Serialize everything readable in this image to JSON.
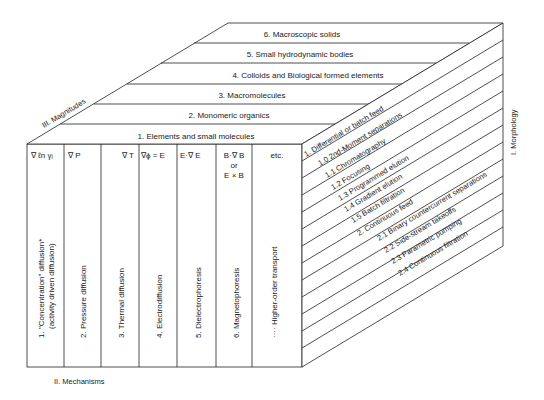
{
  "axes": {
    "magnitudes": "III. Magnitudes",
    "mechanisms": "II. Mechanisms",
    "morphology": "I. Morphology"
  },
  "magnitudes": [
    "1. Elements and small molecules",
    "2. Monomeric organics",
    "3. Macromolecules",
    "4. Colloids and Biological formed elements",
    "5. Small hydrodynamic bodies",
    "6. Macroscopic solids"
  ],
  "mechanisms": [
    {
      "gradient": "∇ ℓn γᵢ",
      "label1": "1.  \"Concentration\" diffusion*",
      "label2": "(activity driven diffusion)"
    },
    {
      "gradient": "∇ P",
      "label1": "2.  Pressure diffusion"
    },
    {
      "gradient": "∇ T",
      "label1": "3.  Thermal diffusion"
    },
    {
      "gradient": "∇ϕ = E",
      "label1": "4.  Electrodiffusion"
    },
    {
      "gradient": "E·∇ E",
      "label1": "5.  Dielectrophoresis"
    },
    {
      "gradient": "B·∇ B",
      "gradient2": "or",
      "gradient3": "E × B",
      "label1": "6.  Magnetophoresis"
    },
    {
      "gradient": "etc.",
      "label1": "····  Higher-order transport"
    }
  ],
  "morphology": [
    "1. Differential or batch feed",
    "1.0 2nd-Moment separations",
    "1.1 Chromatography",
    "1.2 Focusing",
    "1.3 Programmed elution",
    "1.4 Gradient elution",
    "1.5 Batch filtration",
    "2. Continuous feed",
    "2.1 Binary countercurrent separations",
    "2.2 Side-stream takeoffs",
    "2.3 Parametric pumping",
    "2.4 Continuous filtration"
  ]
}
